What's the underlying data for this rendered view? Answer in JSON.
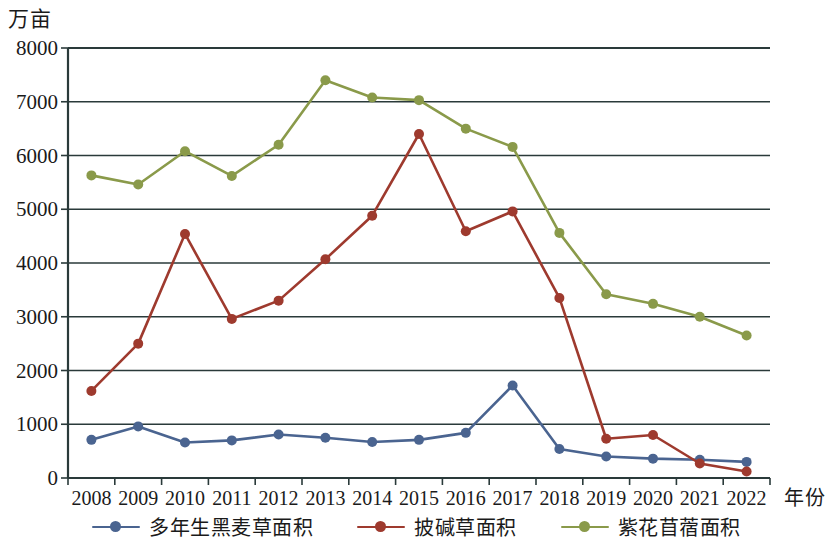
{
  "axes": {
    "y_title": "万亩",
    "x_title": "年份",
    "y_ticks": [
      "0",
      "1000",
      "2000",
      "3000",
      "4000",
      "5000",
      "6000",
      "7000",
      "8000"
    ],
    "x_ticks": [
      "2008",
      "2009",
      "2010",
      "2011",
      "2012",
      "2013",
      "2014",
      "2015",
      "2016",
      "2017",
      "2018",
      "2019",
      "2020",
      "2021",
      "2022"
    ]
  },
  "legend": {
    "items": [
      {
        "label": "多年生黑麦草面积",
        "color": "#4a6490"
      },
      {
        "label": "披碱草面积",
        "color": "#9e3a2e"
      },
      {
        "label": "紫花苜蓿面积",
        "color": "#8a9a4a"
      }
    ]
  },
  "colors": {
    "series_blue": "#4a6490",
    "series_red": "#9e3a2e",
    "series_green": "#8a9a4a",
    "gridline": "#2a3a3a",
    "axis": "#2a3a3a",
    "background": "#ffffff"
  },
  "chart_data": {
    "type": "line",
    "title": "",
    "xlabel": "年份",
    "ylabel": "万亩",
    "x": [
      2008,
      2009,
      2010,
      2011,
      2012,
      2013,
      2014,
      2015,
      2016,
      2017,
      2018,
      2019,
      2020,
      2021,
      2022
    ],
    "categories": [
      "2008",
      "2009",
      "2010",
      "2011",
      "2012",
      "2013",
      "2014",
      "2015",
      "2016",
      "2017",
      "2018",
      "2019",
      "2020",
      "2021",
      "2022"
    ],
    "ylim": [
      0,
      8000
    ],
    "yticks": [
      0,
      1000,
      2000,
      3000,
      4000,
      5000,
      6000,
      7000,
      8000
    ],
    "grid": true,
    "legend_position": "bottom",
    "markers": "circle",
    "series": [
      {
        "name": "多年生黑麦草面积",
        "color": "#4a6490",
        "values": [
          710,
          960,
          660,
          700,
          810,
          750,
          670,
          710,
          840,
          1720,
          540,
          400,
          360,
          340,
          300
        ]
      },
      {
        "name": "披碱草面积",
        "color": "#9e3a2e",
        "values": [
          1620,
          2500,
          4540,
          2960,
          3300,
          4070,
          4880,
          6400,
          4590,
          4960,
          3350,
          730,
          800,
          270,
          120
        ]
      },
      {
        "name": "紫花苜蓿面积",
        "color": "#8a9a4a",
        "values": [
          5630,
          5460,
          6080,
          5620,
          6200,
          7400,
          7080,
          7030,
          6500,
          6160,
          4560,
          3420,
          3240,
          3000,
          2650
        ]
      }
    ]
  }
}
